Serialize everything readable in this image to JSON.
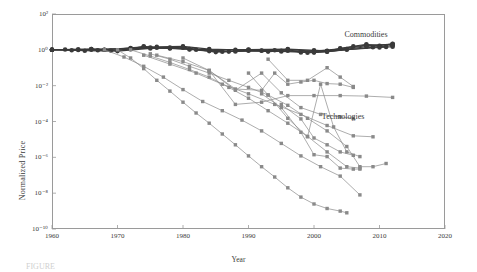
{
  "figure": {
    "caption_fragment": "FIGURE",
    "series_labels": {
      "commodities": "Commodities",
      "technologies": "Technologies"
    },
    "colors": {
      "commodities": "#3a3a3a",
      "technologies": "#8a8a8a",
      "axis": "#9a9a9a",
      "text": "#3b3b3b"
    }
  },
  "chart_data": {
    "type": "line",
    "title": "",
    "xlabel": "Year",
    "ylabel": "Normalized Price",
    "xlim": [
      1960,
      2020
    ],
    "ylim": [
      1e-10,
      100
    ],
    "yscale": "log",
    "xticks": [
      1960,
      1970,
      1980,
      1990,
      2000,
      2010,
      2020
    ],
    "xtick_labels": [
      "1960",
      "1970",
      "1980",
      "1990",
      "2000",
      "2010",
      "2020"
    ],
    "yticks": [
      100,
      1,
      0.01,
      0.0001,
      1e-06,
      1e-08,
      1e-10
    ],
    "ytick_labels": [
      "10²",
      "10⁰",
      "10⁻²",
      "10⁻⁴",
      "10⁻⁶",
      "10⁻⁸",
      "10⁻¹⁰"
    ],
    "grid": false,
    "legend": "annotations",
    "annotations": [
      {
        "text": "Commodities",
        "x": 2008,
        "y": 6.0
      },
      {
        "text": "Technologies",
        "x": 2007,
        "y": 0.00015
      }
    ],
    "groups": [
      {
        "name": "Commodities",
        "marker": "circle",
        "color": "#3a3a3a",
        "series": [
          {
            "name": "commodity-1",
            "x": [
              1960,
              1962,
              1964,
              1966,
              1968,
              1970,
              1972,
              1974,
              1976,
              1978,
              1980,
              1982,
              1984,
              1986,
              1988,
              1990,
              1992,
              1994,
              1996,
              1998,
              2000,
              2002,
              2004,
              2006,
              2008,
              2010,
              2012
            ],
            "y": [
              1.0,
              1.05,
              0.98,
              1.1,
              1.02,
              0.95,
              1.15,
              1.6,
              1.3,
              1.25,
              1.45,
              1.0,
              0.95,
              0.78,
              0.9,
              1.0,
              0.88,
              0.95,
              1.05,
              0.72,
              0.95,
              0.85,
              1.2,
              1.6,
              2.0,
              1.7,
              2.2
            ]
          },
          {
            "name": "commodity-2",
            "x": [
              1960,
              1963,
              1966,
              1969,
              1972,
              1975,
              1978,
              1981,
              1984,
              1987,
              1990,
              1993,
              1996,
              1999,
              2002,
              2005,
              2008,
              2011
            ],
            "y": [
              1.0,
              0.95,
              1.02,
              0.92,
              1.1,
              1.35,
              1.2,
              1.05,
              0.85,
              0.8,
              0.95,
              0.8,
              0.9,
              0.68,
              0.8,
              1.1,
              1.5,
              1.45
            ]
          },
          {
            "name": "commodity-3",
            "x": [
              1960,
              1964,
              1968,
              1972,
              1976,
              1980,
              1984,
              1988,
              1992,
              1996,
              2000,
              2004,
              2008,
              2012
            ],
            "y": [
              1.0,
              1.08,
              1.0,
              1.25,
              1.45,
              1.55,
              1.1,
              1.0,
              0.92,
              1.0,
              0.85,
              1.15,
              1.85,
              1.9
            ]
          },
          {
            "name": "commodity-4",
            "x": [
              1960,
              1965,
              1970,
              1975,
              1980,
              1985,
              1990,
              1995,
              2000,
              2005,
              2010,
              2012
            ],
            "y": [
              1.0,
              0.9,
              0.85,
              1.2,
              1.3,
              0.75,
              0.88,
              0.82,
              0.7,
              1.0,
              1.35,
              1.5
            ]
          },
          {
            "name": "commodity-5",
            "x": [
              1960,
              1966,
              1972,
              1978,
              1984,
              1990,
              1996,
              2002,
              2008,
              2012
            ],
            "y": [
              1.0,
              1.12,
              1.18,
              1.35,
              1.0,
              1.05,
              1.1,
              0.9,
              1.7,
              2.1
            ]
          },
          {
            "name": "commodity-6",
            "x": [
              1960,
              1967,
              1974,
              1981,
              1988,
              1995,
              2002,
              2009,
              2012
            ],
            "y": [
              1.0,
              0.96,
              1.5,
              1.1,
              0.82,
              0.9,
              0.78,
              1.4,
              1.75
            ]
          }
        ]
      },
      {
        "name": "Technologies",
        "marker": "square",
        "color": "#8a8a8a",
        "series": [
          {
            "name": "tech-dram",
            "x": [
              1970,
              1972,
              1974,
              1976,
              1978,
              1980,
              1982,
              1984,
              1986,
              1988,
              1990,
              1992,
              1994,
              1996,
              1998,
              2000,
              2002,
              2004,
              2005
            ],
            "y": [
              1.0,
              0.35,
              0.09,
              0.02,
              0.005,
              0.0012,
              0.0003,
              8e-05,
              2e-05,
              5e-06,
              1.2e-06,
              3e-07,
              8e-08,
              2e-08,
              6e-09,
              2.5e-09,
              1.4e-09,
              1e-09,
              8e-10
            ]
          },
          {
            "name": "tech-transistor",
            "x": [
              1968,
              1971,
              1974,
              1977,
              1980,
              1983,
              1986,
              1989,
              1992,
              1995,
              1998,
              2001,
              2004,
              2007
            ],
            "y": [
              1.0,
              0.4,
              0.12,
              0.03,
              0.006,
              0.0013,
              0.0004,
              0.00012,
              3e-05,
              6e-06,
              1.2e-06,
              3e-07,
              9e-08,
              8e-09
            ]
          },
          {
            "name": "tech-hdd",
            "x": [
              1972,
              1975,
              1978,
              1981,
              1984,
              1987,
              1990,
              1993,
              1996,
              1999,
              2002,
              2005,
              2007
            ],
            "y": [
              1.0,
              0.45,
              0.2,
              0.08,
              0.03,
              0.008,
              0.002,
              0.0004,
              8e-05,
              1.5e-05,
              2e-06,
              3e-07,
              2.5e-07
            ]
          },
          {
            "name": "tech-laser",
            "x": [
              1975,
              1978,
              1981,
              1984,
              1987,
              1990,
              1993,
              1996,
              1999,
              2002,
              2005,
              2007,
              2009,
              2011
            ],
            "y": [
              0.6,
              0.3,
              0.12,
              0.05,
              0.02,
              0.008,
              0.003,
              0.0008,
              0.00015,
              3e-05,
              4e-06,
              3e-07,
              3e-07,
              4.5e-07
            ]
          },
          {
            "name": "tech-photovoltaic",
            "x": [
              1976,
              1980,
              1984,
              1988,
              1992,
              1996,
              2000,
              2004,
              2008,
              2012
            ],
            "y": [
              0.5,
              0.22,
              0.07,
              0.0009,
              0.0012,
              0.0028,
              0.0028,
              0.0028,
              0.0026,
              0.0022
            ]
          },
          {
            "name": "tech-capacitor",
            "x": [
              1974,
              1978,
              1982,
              1986,
              1990,
              1994,
              1998,
              2002,
              2006,
              2009
            ],
            "y": [
              0.5,
              0.16,
              0.05,
              0.012,
              0.0035,
              0.0009,
              0.00025,
              6e-05,
              1.6e-05,
              1.4e-05
            ]
          },
          {
            "name": "tech-wind",
            "x": [
              1980,
              1984,
              1988,
              1992,
              1994,
              1996,
              1998,
              2000,
              2002,
              2004,
              2006
            ],
            "y": [
              0.35,
              0.07,
              0.0065,
              0.0055,
              0.05,
              0.012,
              0.016,
              0.02,
              0.013,
              0.012,
              0.008
            ]
          },
          {
            "name": "tech-ethanol",
            "x": [
              1984,
              1988,
              1992,
              1995,
              1998,
              2001,
              2004,
              2006
            ],
            "y": [
              0.07,
              0.0055,
              0.05,
              0.004,
              0.0006,
              0.00025,
              0.00018,
              0.00015
            ]
          },
          {
            "name": "tech-biodiesel",
            "x": [
              1990,
              1993,
              1996,
              1999,
              2001,
              2003,
              2005,
              2007
            ],
            "y": [
              0.05,
              0.003,
              0.00015,
              1.4e-05,
              0.012,
              5e-05,
              2e-06,
              1.1e-06
            ]
          },
          {
            "name": "tech-led",
            "x": [
              1992,
              1995,
              1998,
              2000,
              2002,
              2004,
              2006,
              2007
            ],
            "y": [
              0.0035,
              0.0006,
              2.5e-05,
              1.4e-06,
              1.1e-06,
              2.5e-07,
              2.2e-07,
              2.2e-07
            ]
          },
          {
            "name": "tech-polysilicon",
            "x": [
              1993,
              1996,
              1999,
              2002,
              2004,
              2006
            ],
            "y": [
              0.3,
              0.02,
              0.02,
              0.1,
              0.03,
              0.009
            ]
          },
          {
            "name": "tech-module",
            "x": [
              1995,
              1998,
              2000,
              2002,
              2004,
              2006
            ],
            "y": [
              0.0009,
              0.00014,
              1.2e-05,
              5e-06,
              2e-06,
              1.3e-06
            ]
          }
        ]
      }
    ]
  }
}
